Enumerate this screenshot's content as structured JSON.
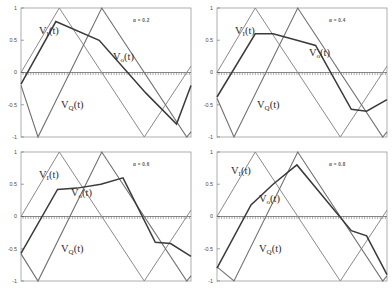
{
  "figure": {
    "title": "",
    "panel_count": 4,
    "background_color": "#ffffff",
    "frame_color": "#8c8c8c"
  },
  "labels": {
    "vi": "V",
    "vi_sub": "I",
    "vi_tail": "(t)",
    "vo": "V",
    "vo_sub": "o",
    "vo_tail": "(t)",
    "vq": "V",
    "vq_sub": "Q",
    "vq_tail": "(t)"
  },
  "yticks": [
    "1",
    "0.5",
    "0",
    "-0.5",
    "-1"
  ],
  "ytick_values": [
    1,
    0.5,
    0,
    -0.5,
    -1
  ],
  "panels": [
    {
      "id": "panel-alpha-02",
      "alpha_label": "α = 0.2",
      "alpha": 0.2,
      "label_pos": {
        "vi": [
          18,
          26
        ],
        "vo": [
          92,
          52
        ],
        "vq": [
          40,
          100
        ]
      }
    },
    {
      "id": "panel-alpha-04",
      "alpha_label": "α = 0.4",
      "alpha": 0.4,
      "label_pos": {
        "vi": [
          18,
          26
        ],
        "vo": [
          92,
          48
        ],
        "vq": [
          40,
          100
        ]
      }
    },
    {
      "id": "panel-alpha-06",
      "alpha_label": "α = 0.6",
      "alpha": 0.6,
      "label_pos": {
        "vi": [
          18,
          26
        ],
        "vo": [
          50,
          44
        ],
        "vq": [
          40,
          100
        ]
      }
    },
    {
      "id": "panel-alpha-08",
      "alpha_label": "α = 0.8",
      "alpha": 0.8,
      "label_pos": {
        "vi": [
          14,
          22
        ],
        "vo": [
          42,
          50
        ],
        "vq": [
          42,
          100
        ]
      }
    }
  ],
  "chart_data": {
    "type": "line",
    "title": "",
    "xlabel": "",
    "ylabel": "",
    "xlim": [
      0,
      1
    ],
    "ylim": [
      -1,
      1
    ],
    "grid": false,
    "legend": "inline-annotations",
    "ytick_labels": [
      "1",
      "0.5",
      "0",
      "-0.5",
      "-1"
    ],
    "ytick_values": [
      1,
      0.5,
      0,
      -0.5,
      -1
    ],
    "xtick_labels": [],
    "series_names": [
      "V_I(t)",
      "V_Q(t)",
      "V_o(t)"
    ],
    "series_colors": {
      "V_I(t)": "#8a8a8a",
      "V_Q(t)": "#6f6f6f",
      "V_o(t)": "#3a3a3a"
    },
    "panels": [
      {
        "alpha": 0.2,
        "annotation": "α = 0.2",
        "series": [
          {
            "name": "V_I(t)",
            "x": [
              0.0,
              0.225,
              0.725,
              1.0
            ],
            "values": [
              0.0,
              1.0,
              -1.0,
              0.1
            ]
          },
          {
            "name": "V_Q(t)",
            "x": [
              0.0,
              0.1,
              0.475,
              0.975,
              1.0
            ],
            "values": [
              -0.2,
              -1.0,
              1.0,
              -1.0,
              -0.92
            ]
          },
          {
            "name": "V_o(t)",
            "x": [
              0.0,
              0.205,
              0.46,
              0.735,
              0.915,
              1.0
            ],
            "values": [
              -0.18,
              0.79,
              0.5,
              -0.32,
              -0.8,
              -0.2
            ]
          }
        ]
      },
      {
        "alpha": 0.4,
        "annotation": "α = 0.4",
        "series": [
          {
            "name": "V_I(t)",
            "x": [
              0.0,
              0.225,
              0.725,
              1.0
            ],
            "values": [
              0.0,
              1.0,
              -1.0,
              0.1
            ]
          },
          {
            "name": "V_Q(t)",
            "x": [
              0.0,
              0.1,
              0.475,
              0.975,
              1.0
            ],
            "values": [
              -0.4,
              -1.0,
              1.0,
              -1.0,
              -0.92
            ]
          },
          {
            "name": "V_o(t)",
            "x": [
              0.0,
              0.225,
              0.33,
              0.47,
              0.58,
              0.79,
              0.88,
              1.0
            ],
            "values": [
              -0.38,
              0.6,
              0.6,
              0.5,
              0.42,
              -0.57,
              -0.6,
              -0.42
            ]
          }
        ]
      },
      {
        "alpha": 0.6,
        "annotation": "α = 0.6",
        "series": [
          {
            "name": "V_I(t)",
            "x": [
              0.0,
              0.225,
              0.725,
              1.0
            ],
            "values": [
              0.0,
              1.0,
              -1.0,
              0.1
            ]
          },
          {
            "name": "V_Q(t)",
            "x": [
              0.0,
              0.1,
              0.475,
              0.975,
              1.0
            ],
            "values": [
              -0.58,
              -1.0,
              1.0,
              -1.0,
              -0.92
            ]
          },
          {
            "name": "V_o(t)",
            "x": [
              0.0,
              0.215,
              0.33,
              0.47,
              0.6,
              0.79,
              0.88,
              1.0
            ],
            "values": [
              -0.57,
              0.42,
              0.44,
              0.5,
              0.6,
              -0.4,
              -0.42,
              -0.62
            ]
          }
        ]
      },
      {
        "alpha": 0.8,
        "annotation": "α = 0.8",
        "series": [
          {
            "name": "V_I(t)",
            "x": [
              0.0,
              0.225,
              0.725,
              1.0
            ],
            "values": [
              0.0,
              1.0,
              -1.0,
              0.1
            ]
          },
          {
            "name": "V_Q(t)",
            "x": [
              0.0,
              0.1,
              0.475,
              0.975,
              1.0
            ],
            "values": [
              -0.78,
              -1.0,
              1.0,
              -1.0,
              -0.92
            ]
          },
          {
            "name": "V_o(t)",
            "x": [
              0.0,
              0.2,
              0.33,
              0.47,
              0.79,
              0.88,
              1.0
            ],
            "values": [
              -0.8,
              0.18,
              0.5,
              0.8,
              -0.22,
              -0.3,
              -0.9
            ]
          }
        ]
      }
    ]
  }
}
